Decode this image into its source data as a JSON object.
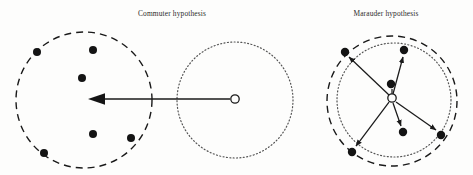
{
  "figure": {
    "type": "diagram",
    "background_color": "#fdfdfc",
    "ink_color": "#1a1a1a",
    "width": 473,
    "height": 175,
    "panels": [
      {
        "id": "commuter",
        "title": "Commuter hypothesis",
        "title_x": 172,
        "title_y": 16,
        "description": "Offender base (open circle) inside a dotted home-range circle, with a long arrow travelling left to a separate dashed crime-site circle containing six offence locations.",
        "crime_circle": {
          "name": "crime-area-circle",
          "style": "dashed",
          "cx": 84,
          "cy": 100,
          "r": 68,
          "dash": "7,5",
          "stroke_width": 1.4
        },
        "home_circle": {
          "name": "home-range-circle",
          "style": "dotted",
          "cx": 235,
          "cy": 100,
          "r": 58,
          "dash": "1,2.4",
          "stroke_width": 1.2
        },
        "anchor_point": {
          "name": "offender-residence-marker",
          "marker": "open-circle",
          "cx": 235,
          "cy": 99,
          "r": 4.2
        },
        "journey_arrow": {
          "name": "journey-to-crime-arrow",
          "x1": 230,
          "y1": 99,
          "x2": 88,
          "y2": 99,
          "direction": "left",
          "stroke_width": 1.6,
          "head_length": 17,
          "head_width": 13
        },
        "offence_points": [
          {
            "cx": 37,
            "cy": 52,
            "r": 4.0
          },
          {
            "cx": 93,
            "cy": 50,
            "r": 4.0
          },
          {
            "cx": 82,
            "cy": 78,
            "r": 4.0
          },
          {
            "cx": 93,
            "cy": 134,
            "r": 4.0
          },
          {
            "cx": 131,
            "cy": 138,
            "r": 4.0
          },
          {
            "cx": 44,
            "cy": 153,
            "r": 4.0
          }
        ]
      },
      {
        "id": "marauder",
        "title": "Marauder hypothesis",
        "title_x": 386,
        "title_y": 16,
        "description": "Offender base (open circle) at the centre of overlapping home-range and crime-area circles, with six short arrows radiating outward to nearby offence locations.",
        "crime_circle": {
          "name": "crime-area-circle",
          "style": "dashed",
          "cx": 392,
          "cy": 101,
          "r": 65,
          "dash": "7,5",
          "stroke_width": 1.4
        },
        "home_circle": {
          "name": "home-range-circle",
          "style": "dotted",
          "cx": 394,
          "cy": 100,
          "r": 57,
          "dash": "1,2.4",
          "stroke_width": 1.2
        },
        "anchor_point": {
          "name": "offender-residence-marker",
          "marker": "open-circle",
          "cx": 392,
          "cy": 98,
          "r": 4.2
        },
        "offence_points": [
          {
            "cx": 345,
            "cy": 52,
            "r": 4.2
          },
          {
            "cx": 404,
            "cy": 50,
            "r": 4.2
          },
          {
            "cx": 391,
            "cy": 84,
            "r": 4.2
          },
          {
            "cx": 352,
            "cy": 152,
            "r": 4.2
          },
          {
            "cx": 403,
            "cy": 132,
            "r": 4.2
          },
          {
            "cx": 441,
            "cy": 135,
            "r": 4.2
          }
        ],
        "journey_arrows": [
          {
            "name": "arrow-to-offence-1",
            "x1": 389,
            "y1": 95,
            "x2": 349,
            "y2": 57
          },
          {
            "name": "arrow-to-offence-2",
            "x1": 393,
            "y1": 94,
            "x2": 403,
            "y2": 56
          },
          {
            "name": "arrow-to-offence-3",
            "x1": 392,
            "y1": 94,
            "x2": 392,
            "y2": 89
          },
          {
            "name": "arrow-to-offence-4",
            "x1": 389,
            "y1": 102,
            "x2": 356,
            "y2": 146
          },
          {
            "name": "arrow-to-offence-5",
            "x1": 393,
            "y1": 103,
            "x2": 401,
            "y2": 126
          },
          {
            "name": "arrow-to-offence-6",
            "x1": 396,
            "y1": 102,
            "x2": 436,
            "y2": 130
          }
        ]
      }
    ],
    "legend": {
      "open_circle_meaning": "offender residence / anchor point",
      "filled_circle_meaning": "offence location"
    }
  }
}
